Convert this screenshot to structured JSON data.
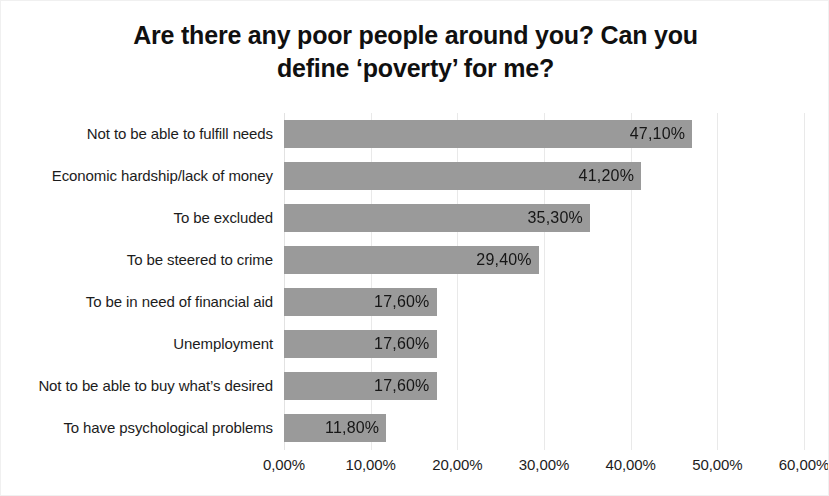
{
  "chart_data": {
    "type": "bar",
    "orientation": "horizontal",
    "title": "Are there any poor people around you?  Can you\ndefine ‘poverty’ for me?",
    "xlabel": "",
    "ylabel": "",
    "xlim": [
      0,
      60
    ],
    "grid": true,
    "legend": "none",
    "bar_color": "#9a9a9a",
    "categories": [
      "Not to be able to fulfill needs",
      "Economic hardship/lack of money",
      "To be excluded",
      "To be steered to crime",
      "To be in need of financial aid",
      "Unemployment",
      "Not to be able to buy what’s desired",
      "To have psychological problems"
    ],
    "values": [
      47.1,
      41.2,
      35.3,
      29.4,
      17.6,
      17.6,
      17.6,
      11.8
    ],
    "value_labels": [
      "47,10%",
      "41,20%",
      "35,30%",
      "29,40%",
      "17,60%",
      "17,60%",
      "17,60%",
      "11,80%"
    ],
    "x_ticks": [
      0,
      10,
      20,
      30,
      40,
      50,
      60
    ],
    "x_tick_labels": [
      "0,00%",
      "10,00%",
      "20,00%",
      "30,00%",
      "40,00%",
      "50,00%",
      "60,00%"
    ]
  }
}
